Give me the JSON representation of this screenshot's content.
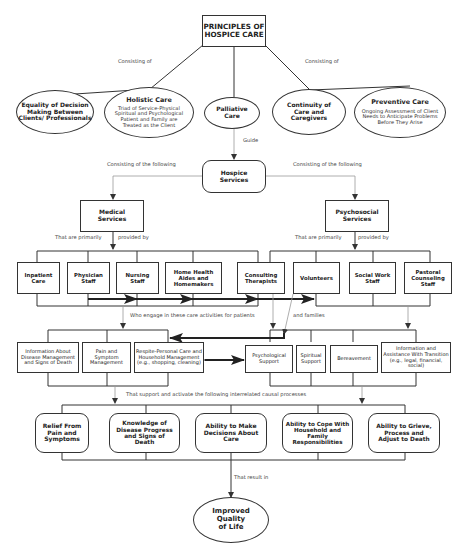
{
  "root": {
    "label": "PRINCIPLES OF HOSPICE CARE"
  },
  "edge_labels": {
    "consisting_of_left": "Consisting of",
    "consisting_of_right": "Consisting of",
    "guide": "Guide",
    "consisting_following_left": "Consisting of the following",
    "consisting_following_right": "Consisting of the following",
    "primarily_left": "That are primarily",
    "provided_by_left": "provided by",
    "primarily_right": "That are primarily",
    "provided_by_right": "provided by",
    "who_engage": "Who engage in these care activities for patients",
    "and_families": "and families",
    "support_activate": "That support and activate the following interrelated causal processes",
    "result_in": "That result in"
  },
  "principles": [
    {
      "title": "Equality of Decision Making Between Clients/ Professionals",
      "desc": ""
    },
    {
      "title": "Holistic Care",
      "desc": "Triad of Service-Physical Spiritual and Psychological Patient and Family are Treated as the Client"
    },
    {
      "title": "Palliative Care",
      "desc": ""
    },
    {
      "title": "Continuity of Care and Caregivers",
      "desc": ""
    },
    {
      "title": "Preventive Care",
      "desc": "Ongoing Assessment of Client Needs to Anticipate Problems Before They Arise"
    }
  ],
  "hospice_services": {
    "label": "Hospice Services"
  },
  "service_types": [
    {
      "label": "Medical Services"
    },
    {
      "label": "Psychosocial Services"
    }
  ],
  "providers": [
    {
      "label": "Inpatient Care"
    },
    {
      "label": "Physician Staff"
    },
    {
      "label": "Nursing Staff"
    },
    {
      "label": "Home Health Aides and Homemakers"
    },
    {
      "label": "Consulting Therapists"
    },
    {
      "label": "Volunteers"
    },
    {
      "label": "Social Work Staff"
    },
    {
      "label": "Pastoral Counseling Staff"
    }
  ],
  "activities": [
    {
      "label": "Information About Disease Management and Signs of Death"
    },
    {
      "label": "Pain and Symptom Management"
    },
    {
      "label": "Respite-Personal Care and Household Management (e.g., shopping, cleaning)"
    },
    {
      "label": "Psychological Support"
    },
    {
      "label": "Spiritual Support"
    },
    {
      "label": "Bereavement"
    },
    {
      "label": "Information and Assistance With Transition (e.g., legal, financial, social)"
    }
  ],
  "processes": [
    {
      "label": "Relief From Pain and Symptoms"
    },
    {
      "label": "Knowledge of Disease Progress and Signs of Death"
    },
    {
      "label": "Ability to Make Decisions About Care"
    },
    {
      "label": "Ability to Cope With Household and Family Responsibilities"
    },
    {
      "label": "Ability to Grieve, Process and Adjust to Death"
    }
  ],
  "outcome": {
    "label": "Improved Quality of Life"
  },
  "colors": {
    "line": "#333333",
    "thin_line": "#999999",
    "background": "#ffffff"
  }
}
